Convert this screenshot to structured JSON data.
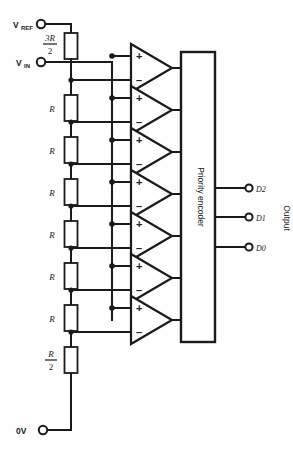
{
  "diagram": {
    "terminals": [
      {
        "id": "vref",
        "label": "V",
        "sub": "REF",
        "x": 38,
        "y": 24
      },
      {
        "id": "vin",
        "label": "V",
        "sub": "IN",
        "x": 38,
        "y": 62
      },
      {
        "id": "gnd",
        "label": "0V",
        "sub": "",
        "x": 38,
        "y": 430
      }
    ],
    "resistors": [
      {
        "id": "r-top",
        "num": "3R",
        "den": "2",
        "is_fraction": true,
        "label": "3R/2",
        "y": 43
      },
      {
        "id": "r-1",
        "num": "R",
        "den": "",
        "is_fraction": false,
        "label": "R",
        "y": 105
      },
      {
        "id": "r-2",
        "num": "R",
        "den": "",
        "is_fraction": false,
        "label": "R",
        "y": 147
      },
      {
        "id": "r-3",
        "num": "R",
        "den": "",
        "is_fraction": false,
        "label": "R",
        "y": 189
      },
      {
        "id": "r-4",
        "num": "R",
        "den": "",
        "is_fraction": false,
        "label": "R",
        "y": 231
      },
      {
        "id": "r-5",
        "num": "R",
        "den": "",
        "is_fraction": false,
        "label": "R",
        "y": 273
      },
      {
        "id": "r-6",
        "num": "R",
        "den": "",
        "is_fraction": false,
        "label": "R",
        "y": 315
      },
      {
        "id": "r-bottom",
        "num": "R",
        "den": "2",
        "is_fraction": true,
        "label": "R/2",
        "y": 360
      }
    ],
    "comparators": [
      {
        "id": "comp-1",
        "plus": "+",
        "minus": "–",
        "y": 68
      },
      {
        "id": "comp-2",
        "plus": "+",
        "minus": "–",
        "y": 110
      },
      {
        "id": "comp-3",
        "plus": "+",
        "minus": "–",
        "y": 152
      },
      {
        "id": "comp-4",
        "plus": "+",
        "minus": "–",
        "y": 194
      },
      {
        "id": "comp-5",
        "plus": "+",
        "minus": "–",
        "y": 236
      },
      {
        "id": "comp-6",
        "plus": "+",
        "minus": "–",
        "y": 278
      },
      {
        "id": "comp-7",
        "plus": "+",
        "minus": "–",
        "y": 320
      }
    ],
    "encoder": {
      "label": "Priority encoder",
      "x": 181,
      "y": 52,
      "width": 34,
      "height": 290
    },
    "outputs": {
      "group_label": "Output",
      "pins": [
        {
          "id": "d2",
          "label": "D2",
          "y": 188
        },
        {
          "id": "d1",
          "label": "D1",
          "y": 217
        },
        {
          "id": "d0",
          "label": "D0",
          "y": 247
        }
      ]
    },
    "colors": {
      "ink": "#1a1a1a",
      "background": "#ffffff"
    }
  }
}
